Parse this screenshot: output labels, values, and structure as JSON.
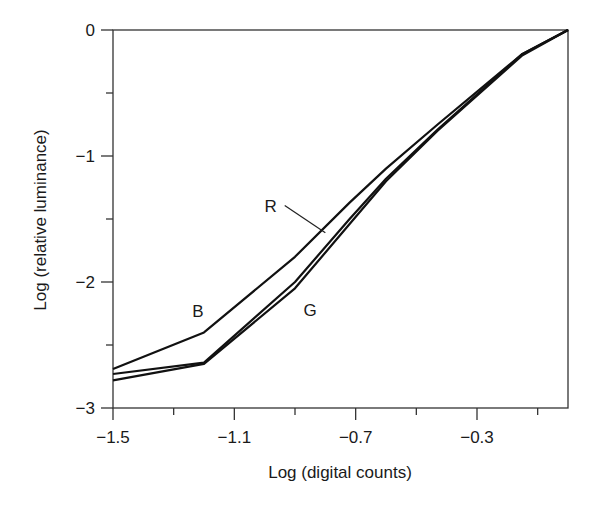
{
  "chart_data": {
    "type": "line",
    "title": "",
    "xlabel": "Log (digital counts)",
    "ylabel": "Log (relative luminance)",
    "xlim": [
      -1.5,
      0.0
    ],
    "ylim": [
      -3,
      0
    ],
    "grid": false,
    "legend": "inline labels",
    "x_ticks": [
      {
        "value": -1.5,
        "label": "−1.5"
      },
      {
        "value": -1.1,
        "label": "−1.1"
      },
      {
        "value": -0.7,
        "label": "−0.7"
      },
      {
        "value": -0.3,
        "label": "−0.3"
      }
    ],
    "x_minor_ticks": [
      -1.3,
      -0.9,
      -0.5,
      -0.1
    ],
    "y_ticks": [
      {
        "value": 0,
        "label": "0"
      },
      {
        "value": -1,
        "label": "−1"
      },
      {
        "value": -2,
        "label": "−2"
      },
      {
        "value": -3,
        "label": "−3"
      }
    ],
    "y_minor_ticks": [
      -0.5,
      -1.5,
      -2.5
    ],
    "series": [
      {
        "name": "B",
        "x": [
          -1.5,
          -1.2,
          -0.9,
          -0.72,
          -0.6,
          -0.43,
          -0.15,
          0.0
        ],
        "y": [
          -2.69,
          -2.4,
          -1.8,
          -1.37,
          -1.1,
          -0.75,
          -0.19,
          0.0
        ]
      },
      {
        "name": "R",
        "x": [
          -1.5,
          -1.2,
          -0.9,
          -0.72,
          -0.6,
          -0.43,
          -0.15,
          0.0
        ],
        "y": [
          -2.73,
          -2.64,
          -2.0,
          -1.5,
          -1.18,
          -0.79,
          -0.19,
          0.0
        ]
      },
      {
        "name": "G",
        "x": [
          -1.5,
          -1.2,
          -0.9,
          -0.72,
          -0.6,
          -0.43,
          -0.15,
          0.0
        ],
        "y": [
          -2.78,
          -2.65,
          -2.05,
          -1.54,
          -1.2,
          -0.8,
          -0.2,
          0.0
        ]
      }
    ],
    "annotations": [
      {
        "text": "B",
        "x": -1.22,
        "y": -2.23
      },
      {
        "text": "R",
        "x": -0.98,
        "y": -1.4,
        "leader_to": {
          "x": -0.8,
          "y": -1.61
        }
      },
      {
        "text": "G",
        "x": -0.85,
        "y": -2.22
      }
    ]
  }
}
